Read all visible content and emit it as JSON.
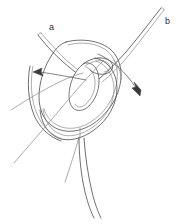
{
  "figure": {
    "background_color": "#ffffff",
    "width": 181,
    "height": 224,
    "stroke_color": "#4a4a4a",
    "thin_stroke_color": "#808080",
    "label_color": "#2d2d2d"
  },
  "labels": {
    "a": "a",
    "b": "b"
  },
  "annotations": [
    {
      "id": "strand-a",
      "label": "a",
      "description": "upper-left suture strand end",
      "x": 49,
      "y": 23
    },
    {
      "id": "strand-b",
      "label": "b",
      "description": "upper-right suture strand end",
      "x": 165,
      "y": 17
    }
  ],
  "arrows": [
    {
      "id": "arrow-left",
      "direction": "left",
      "tip_x": 34,
      "tip_y": 72,
      "description": "pull direction arrow toward left"
    },
    {
      "id": "arrow-right",
      "direction": "down-right",
      "tip_x": 140,
      "tip_y": 95,
      "description": "pull direction arrow toward lower right"
    }
  ],
  "shapes": [
    {
      "id": "outer-loop",
      "type": "circle-loop",
      "description": "large suture loop circle"
    },
    {
      "id": "inner-instrument",
      "type": "rounded-blade",
      "description": "central pointed instrument or tissue element"
    },
    {
      "id": "secondary-loop",
      "type": "curve-loop",
      "description": "second throw loop of the knot"
    },
    {
      "id": "tail-strands",
      "type": "paired-lines",
      "description": "paired suture tails exiting bottom"
    },
    {
      "id": "diagonal-needle",
      "type": "line",
      "description": "long needle line crossing from lower-left"
    }
  ]
}
